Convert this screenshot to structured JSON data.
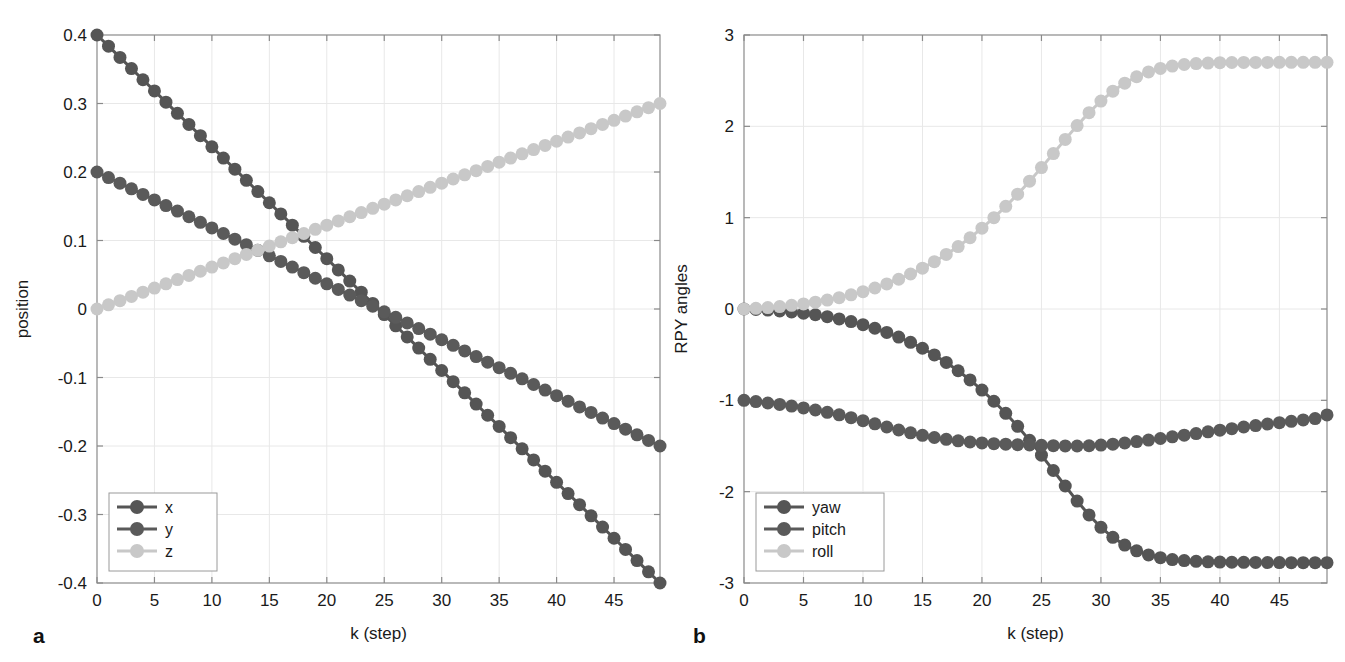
{
  "figure": {
    "panels": [
      {
        "letter": "a"
      },
      {
        "letter": "b"
      }
    ]
  },
  "chart_data": [
    {
      "type": "line",
      "panel_label": "a",
      "title": "",
      "xlabel": "k (step)",
      "ylabel": "position",
      "xlim": [
        0,
        49
      ],
      "ylim": [
        -0.4,
        0.4
      ],
      "xticks": [
        0,
        5,
        10,
        15,
        20,
        25,
        30,
        35,
        40,
        45
      ],
      "xtick_labels": [
        "0",
        "5",
        "10",
        "15",
        "20",
        "25",
        "30",
        "35",
        "40",
        "45"
      ],
      "yticks": [
        -0.4,
        -0.3,
        -0.2,
        -0.1,
        0,
        0.1,
        0.2,
        0.3,
        0.4
      ],
      "ytick_labels": [
        "-0.4",
        "-0.3",
        "-0.2",
        "-0.1",
        "0",
        "0.1",
        "0.2",
        "0.3",
        "0.4"
      ],
      "grid": true,
      "legend_position": "lower-left",
      "marker": "circle",
      "x": [
        0,
        1,
        2,
        3,
        4,
        5,
        6,
        7,
        8,
        9,
        10,
        11,
        12,
        13,
        14,
        15,
        16,
        17,
        18,
        19,
        20,
        21,
        22,
        23,
        24,
        25,
        26,
        27,
        28,
        29,
        30,
        31,
        32,
        33,
        34,
        35,
        36,
        37,
        38,
        39,
        40,
        41,
        42,
        43,
        44,
        45,
        46,
        47,
        48,
        49
      ],
      "series": [
        {
          "name": "x",
          "color": "#555555",
          "values": [
            0.4,
            0.3837,
            0.3673,
            0.351,
            0.3347,
            0.3184,
            0.302,
            0.2857,
            0.2694,
            0.2531,
            0.2367,
            0.2204,
            0.2041,
            0.1878,
            0.1714,
            0.1551,
            0.1388,
            0.1224,
            0.1061,
            0.0898,
            0.0735,
            0.0571,
            0.0408,
            0.0245,
            0.0082,
            -0.0082,
            -0.0245,
            -0.0408,
            -0.0571,
            -0.0735,
            -0.0898,
            -0.1061,
            -0.1224,
            -0.1388,
            -0.1551,
            -0.1714,
            -0.1878,
            -0.2041,
            -0.2204,
            -0.2367,
            -0.2531,
            -0.2694,
            -0.2857,
            -0.302,
            -0.3184,
            -0.3347,
            -0.351,
            -0.3673,
            -0.3837,
            -0.4
          ]
        },
        {
          "name": "y",
          "color": "#5a5a5a",
          "values": [
            0.2,
            0.1918,
            0.1837,
            0.1755,
            0.1673,
            0.1592,
            0.151,
            0.1429,
            0.1347,
            0.1265,
            0.1184,
            0.1102,
            0.102,
            0.0939,
            0.0857,
            0.0776,
            0.0694,
            0.0612,
            0.0531,
            0.0449,
            0.0367,
            0.0286,
            0.0204,
            0.0122,
            0.0041,
            -0.0041,
            -0.0122,
            -0.0204,
            -0.0286,
            -0.0367,
            -0.0449,
            -0.0531,
            -0.0612,
            -0.0694,
            -0.0776,
            -0.0857,
            -0.0939,
            -0.102,
            -0.1102,
            -0.1184,
            -0.1265,
            -0.1347,
            -0.1429,
            -0.151,
            -0.1592,
            -0.1673,
            -0.1755,
            -0.1837,
            -0.1918,
            -0.2
          ]
        },
        {
          "name": "z",
          "color": "#c8c8c8",
          "values": [
            0,
            0.0061,
            0.0122,
            0.0184,
            0.0245,
            0.0306,
            0.0367,
            0.0429,
            0.049,
            0.0551,
            0.0612,
            0.0673,
            0.0735,
            0.0796,
            0.0857,
            0.0918,
            0.098,
            0.1041,
            0.1102,
            0.1163,
            0.1224,
            0.1286,
            0.1347,
            0.1408,
            0.1469,
            0.1531,
            0.1592,
            0.1653,
            0.1714,
            0.1776,
            0.1837,
            0.1898,
            0.1959,
            0.202,
            0.2082,
            0.2143,
            0.2204,
            0.2265,
            0.2327,
            0.2388,
            0.2449,
            0.251,
            0.2571,
            0.2633,
            0.2694,
            0.2755,
            0.2816,
            0.2878,
            0.2939,
            0.3
          ]
        }
      ]
    },
    {
      "type": "line",
      "panel_label": "b",
      "title": "",
      "xlabel": "k (step)",
      "ylabel": "RPY angles",
      "xlim": [
        0,
        49
      ],
      "ylim": [
        -3,
        3
      ],
      "xticks": [
        0,
        5,
        10,
        15,
        20,
        25,
        30,
        35,
        40,
        45
      ],
      "xtick_labels": [
        "0",
        "5",
        "10",
        "15",
        "20",
        "25",
        "30",
        "35",
        "40",
        "45"
      ],
      "yticks": [
        -3,
        -2,
        -1,
        0,
        1,
        2,
        3
      ],
      "ytick_labels": [
        "-3",
        "-2",
        "-1",
        "0",
        "1",
        "2",
        "3"
      ],
      "grid": true,
      "legend_position": "lower-left",
      "marker": "circle",
      "x": [
        0,
        1,
        2,
        3,
        4,
        5,
        6,
        7,
        8,
        9,
        10,
        11,
        12,
        13,
        14,
        15,
        16,
        17,
        18,
        19,
        20,
        21,
        22,
        23,
        24,
        25,
        26,
        27,
        28,
        29,
        30,
        31,
        32,
        33,
        34,
        35,
        36,
        37,
        38,
        39,
        40,
        41,
        42,
        43,
        44,
        45,
        46,
        47,
        48,
        49
      ],
      "series": [
        {
          "name": "yaw",
          "color": "#555555",
          "values": [
            0,
            -0.005,
            -0.012,
            -0.021,
            -0.032,
            -0.046,
            -0.063,
            -0.084,
            -0.109,
            -0.138,
            -0.172,
            -0.211,
            -0.256,
            -0.307,
            -0.365,
            -0.43,
            -0.503,
            -0.585,
            -0.676,
            -0.777,
            -0.888,
            -1.01,
            -1.142,
            -1.285,
            -1.438,
            -1.6,
            -1.768,
            -1.938,
            -2.103,
            -2.255,
            -2.39,
            -2.5,
            -2.585,
            -2.648,
            -2.693,
            -2.723,
            -2.743,
            -2.755,
            -2.763,
            -2.768,
            -2.771,
            -2.773,
            -2.774,
            -2.775,
            -2.776,
            -2.776,
            -2.777,
            -2.777,
            -2.777,
            -2.777
          ]
        },
        {
          "name": "pitch",
          "color": "#5a5a5a",
          "values": [
            -1,
            -1.014,
            -1.029,
            -1.045,
            -1.063,
            -1.083,
            -1.106,
            -1.131,
            -1.159,
            -1.19,
            -1.223,
            -1.257,
            -1.292,
            -1.325,
            -1.356,
            -1.383,
            -1.407,
            -1.427,
            -1.443,
            -1.456,
            -1.466,
            -1.474,
            -1.48,
            -1.485,
            -1.489,
            -1.493,
            -1.496,
            -1.499,
            -1.5,
            -1.497,
            -1.49,
            -1.48,
            -1.467,
            -1.452,
            -1.435,
            -1.418,
            -1.4,
            -1.382,
            -1.364,
            -1.345,
            -1.327,
            -1.31,
            -1.292,
            -1.276,
            -1.26,
            -1.245,
            -1.23,
            -1.215,
            -1.2,
            -1.16
          ]
        },
        {
          "name": "roll",
          "color": "#c8c8c8",
          "values": [
            0,
            0.007,
            0.016,
            0.027,
            0.04,
            0.056,
            0.075,
            0.098,
            0.124,
            0.155,
            0.19,
            0.23,
            0.275,
            0.326,
            0.383,
            0.447,
            0.518,
            0.597,
            0.684,
            0.78,
            0.885,
            1,
            1.124,
            1.257,
            1.399,
            1.548,
            1.702,
            1.857,
            2.008,
            2.15,
            2.277,
            2.385,
            2.473,
            2.543,
            2.596,
            2.634,
            2.66,
            2.677,
            2.687,
            2.693,
            2.697,
            2.699,
            2.7,
            2.7,
            2.7,
            2.701,
            2.701,
            2.701,
            2.701,
            2.701
          ]
        }
      ]
    }
  ]
}
